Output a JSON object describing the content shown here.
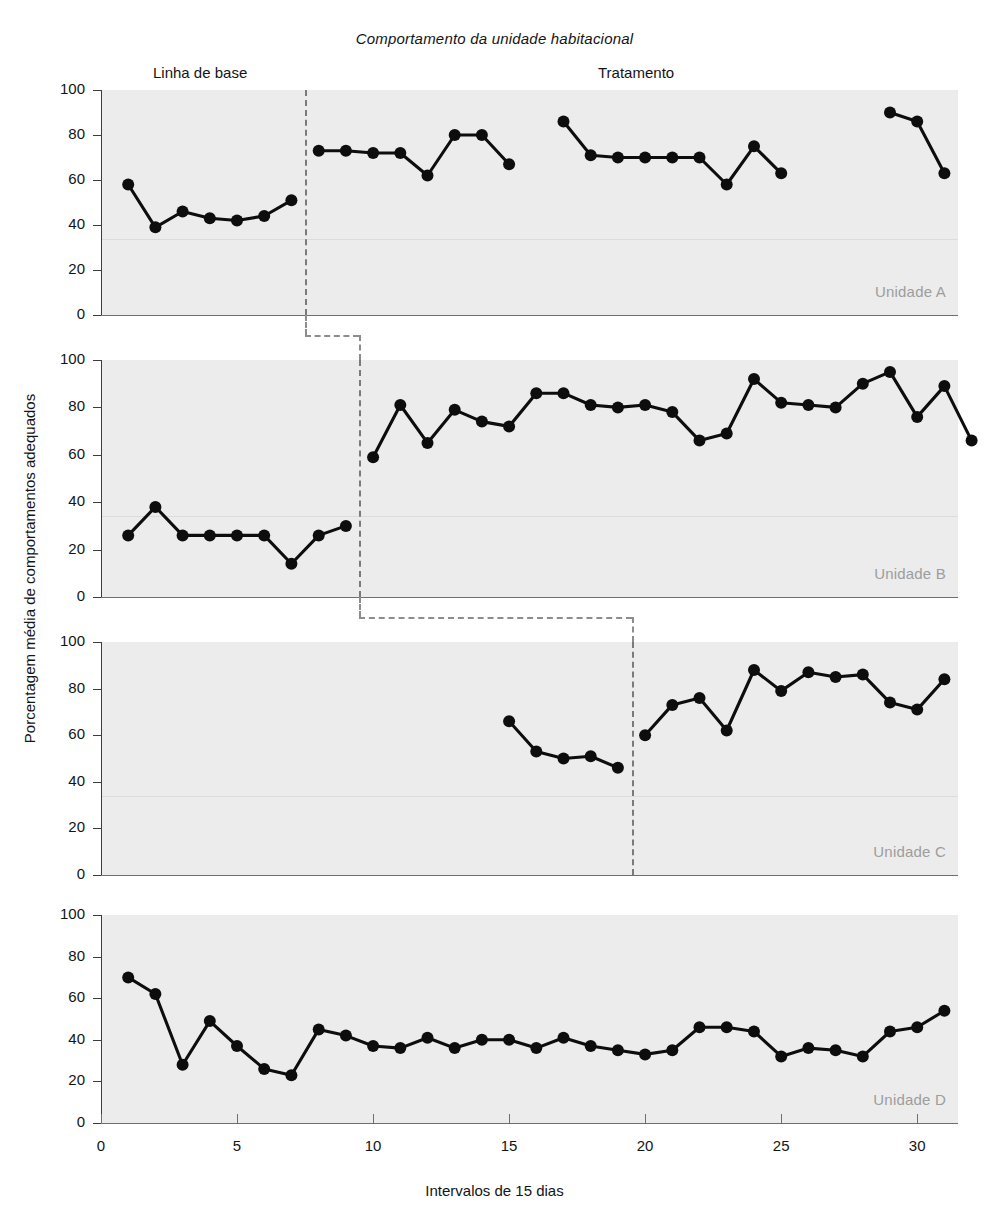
{
  "chart_data": {
    "type": "line",
    "title": "Comportamento da unidade habitacional",
    "xlabel": "Intervalos de 15 dias",
    "ylabel": "Porcentagem média de comportamentos adequados",
    "xlim": [
      0,
      31.5
    ],
    "ylim": [
      0,
      100
    ],
    "xticks": [
      0,
      5,
      10,
      15,
      20,
      25,
      30
    ],
    "yticks": [
      0,
      20,
      40,
      60,
      80,
      100
    ],
    "grid": false,
    "legend": "none",
    "phase_labels": [
      {
        "text": "Linha de base",
        "x_center": 9.5
      },
      {
        "text": "Tratamento",
        "x_center": 72.0
      }
    ],
    "annotations": [
      "Linha de base",
      "Tratamento"
    ],
    "panels": [
      {
        "name": "Unidade A",
        "phase_change_x": 7.5,
        "series": [
          {
            "name": "Linha de base",
            "points": [
              {
                "x": 1,
                "y": 58
              },
              {
                "x": 2,
                "y": 39
              },
              {
                "x": 3,
                "y": 46
              },
              {
                "x": 4,
                "y": 43
              },
              {
                "x": 5,
                "y": 42
              },
              {
                "x": 6,
                "y": 44
              },
              {
                "x": 7,
                "y": 51
              }
            ]
          },
          {
            "name": "Tratamento segmento 1",
            "points": [
              {
                "x": 8,
                "y": 73
              },
              {
                "x": 9,
                "y": 73
              },
              {
                "x": 10,
                "y": 72
              },
              {
                "x": 11,
                "y": 72
              },
              {
                "x": 12,
                "y": 62
              },
              {
                "x": 13,
                "y": 80
              },
              {
                "x": 14,
                "y": 80
              },
              {
                "x": 15,
                "y": 67
              }
            ]
          },
          {
            "name": "Tratamento segmento 2",
            "points": [
              {
                "x": 17,
                "y": 86
              },
              {
                "x": 18,
                "y": 71
              },
              {
                "x": 19,
                "y": 70
              },
              {
                "x": 20,
                "y": 70
              },
              {
                "x": 21,
                "y": 70
              },
              {
                "x": 22,
                "y": 70
              },
              {
                "x": 23,
                "y": 58
              },
              {
                "x": 24,
                "y": 75
              },
              {
                "x": 25,
                "y": 63
              }
            ]
          },
          {
            "name": "Tratamento segmento 3",
            "points": [
              {
                "x": 29,
                "y": 90
              },
              {
                "x": 30,
                "y": 86
              },
              {
                "x": 31,
                "y": 63
              }
            ]
          }
        ]
      },
      {
        "name": "Unidade B",
        "phase_change_x": 9.5,
        "series": [
          {
            "name": "Linha de base",
            "points": [
              {
                "x": 1,
                "y": 26
              },
              {
                "x": 2,
                "y": 38
              },
              {
                "x": 3,
                "y": 26
              },
              {
                "x": 4,
                "y": 26
              },
              {
                "x": 5,
                "y": 26
              },
              {
                "x": 6,
                "y": 26
              },
              {
                "x": 7,
                "y": 14
              },
              {
                "x": 8,
                "y": 26
              },
              {
                "x": 9,
                "y": 30
              }
            ]
          },
          {
            "name": "Tratamento",
            "points": [
              {
                "x": 10,
                "y": 59
              },
              {
                "x": 11,
                "y": 81
              },
              {
                "x": 12,
                "y": 65
              },
              {
                "x": 13,
                "y": 79
              },
              {
                "x": 14,
                "y": 74
              },
              {
                "x": 15,
                "y": 72
              },
              {
                "x": 16,
                "y": 86
              },
              {
                "x": 17,
                "y": 86
              },
              {
                "x": 18,
                "y": 81
              },
              {
                "x": 19,
                "y": 80
              },
              {
                "x": 20,
                "y": 81
              },
              {
                "x": 21,
                "y": 78
              },
              {
                "x": 22,
                "y": 66
              },
              {
                "x": 23,
                "y": 69
              },
              {
                "x": 24,
                "y": 92
              },
              {
                "x": 25,
                "y": 82
              },
              {
                "x": 26,
                "y": 81
              },
              {
                "x": 27,
                "y": 80
              },
              {
                "x": 28,
                "y": 90
              },
              {
                "x": 29,
                "y": 95
              },
              {
                "x": 30,
                "y": 76
              },
              {
                "x": 31,
                "y": 89
              },
              {
                "x": 32,
                "y": 66
              }
            ]
          }
        ]
      },
      {
        "name": "Unidade C",
        "phase_change_x": 19.5,
        "series": [
          {
            "name": "Linha de base",
            "points": [
              {
                "x": 15,
                "y": 66
              },
              {
                "x": 16,
                "y": 53
              },
              {
                "x": 17,
                "y": 50
              },
              {
                "x": 18,
                "y": 51
              },
              {
                "x": 19,
                "y": 46
              }
            ]
          },
          {
            "name": "Tratamento",
            "points": [
              {
                "x": 20,
                "y": 60
              },
              {
                "x": 21,
                "y": 73
              },
              {
                "x": 22,
                "y": 76
              },
              {
                "x": 23,
                "y": 62
              },
              {
                "x": 24,
                "y": 88
              },
              {
                "x": 25,
                "y": 79
              },
              {
                "x": 26,
                "y": 87
              },
              {
                "x": 27,
                "y": 85
              },
              {
                "x": 28,
                "y": 86
              },
              {
                "x": 29,
                "y": 74
              },
              {
                "x": 30,
                "y": 71
              },
              {
                "x": 31,
                "y": 84
              }
            ]
          }
        ]
      },
      {
        "name": "Unidade D",
        "phase_change_x": null,
        "series": [
          {
            "name": "Linha de base",
            "points": [
              {
                "x": 1,
                "y": 70
              },
              {
                "x": 2,
                "y": 62
              },
              {
                "x": 3,
                "y": 28
              },
              {
                "x": 4,
                "y": 49
              },
              {
                "x": 5,
                "y": 37
              },
              {
                "x": 6,
                "y": 26
              },
              {
                "x": 7,
                "y": 23
              },
              {
                "x": 8,
                "y": 45
              },
              {
                "x": 9,
                "y": 42
              },
              {
                "x": 10,
                "y": 37
              },
              {
                "x": 11,
                "y": 36
              },
              {
                "x": 12,
                "y": 41
              },
              {
                "x": 13,
                "y": 36
              },
              {
                "x": 14,
                "y": 40
              },
              {
                "x": 15,
                "y": 40
              },
              {
                "x": 16,
                "y": 36
              },
              {
                "x": 17,
                "y": 41
              },
              {
                "x": 18,
                "y": 37
              },
              {
                "x": 19,
                "y": 35
              },
              {
                "x": 20,
                "y": 33
              },
              {
                "x": 21,
                "y": 35
              },
              {
                "x": 22,
                "y": 46
              },
              {
                "x": 23,
                "y": 46
              },
              {
                "x": 24,
                "y": 44
              },
              {
                "x": 25,
                "y": 32
              },
              {
                "x": 26,
                "y": 36
              },
              {
                "x": 27,
                "y": 35
              },
              {
                "x": 28,
                "y": 32
              },
              {
                "x": 29,
                "y": 44
              },
              {
                "x": 30,
                "y": 46
              },
              {
                "x": 31,
                "y": 54
              }
            ]
          }
        ]
      }
    ]
  },
  "colors": {
    "plot_background": "#ececec",
    "series": "#0d0d0d",
    "axis": "#3c3c3c",
    "phase_line": "#7a7a7a",
    "unit_label": "#9d9d9d"
  }
}
